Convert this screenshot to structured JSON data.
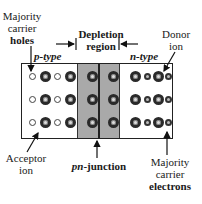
{
  "diagram": {
    "labels": {
      "majority_holes": [
        "Majority",
        "carrier",
        "holes"
      ],
      "depletion": [
        "Depletion",
        "region"
      ],
      "donor": [
        "Donor",
        "ion"
      ],
      "p_type": "p-type",
      "n_type": "n-type",
      "acceptor": [
        "Acceptor",
        "ion"
      ],
      "junction_prefix": "pn",
      "junction_suffix": "-junction",
      "majority_electrons": [
        "Majority",
        "carrier",
        "electrons"
      ]
    },
    "regions": [
      {
        "name": "p-type",
        "contents": [
          "hole",
          "acceptor ion"
        ]
      },
      {
        "name": "depletion region",
        "contents": [
          "acceptor ion",
          "donor ion"
        ]
      },
      {
        "name": "n-type",
        "contents": [
          "donor ion",
          "electron"
        ]
      }
    ],
    "colors": {
      "depletion_fill": "#a9a9a9",
      "outline": "#222222"
    }
  }
}
